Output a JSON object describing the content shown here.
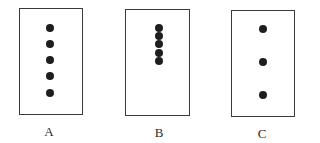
{
  "figure": {
    "panels": [
      {
        "label": "A",
        "box": {
          "x": 19,
          "y": 8,
          "w": 64,
          "h": 107
        },
        "dot_count": 5,
        "dots": [
          {
            "x": 50,
            "y": 28
          },
          {
            "x": 50,
            "y": 44
          },
          {
            "x": 50,
            "y": 60
          },
          {
            "x": 50,
            "y": 76
          },
          {
            "x": 50,
            "y": 93
          }
        ],
        "label_pos": {
          "x": 49,
          "y": 125
        }
      },
      {
        "label": "B",
        "box": {
          "x": 125,
          "y": 9,
          "w": 65,
          "h": 107
        },
        "dot_count": 5,
        "dots": [
          {
            "x": 159,
            "y": 28
          },
          {
            "x": 159,
            "y": 36
          },
          {
            "x": 159,
            "y": 44
          },
          {
            "x": 159,
            "y": 53
          },
          {
            "x": 159,
            "y": 61
          }
        ],
        "label_pos": {
          "x": 159,
          "y": 126
        }
      },
      {
        "label": "C",
        "box": {
          "x": 231,
          "y": 10,
          "w": 64,
          "h": 107
        },
        "dot_count": 3,
        "dots": [
          {
            "x": 263,
            "y": 29
          },
          {
            "x": 263,
            "y": 62
          },
          {
            "x": 263,
            "y": 95
          }
        ],
        "label_pos": {
          "x": 262,
          "y": 127
        }
      }
    ],
    "colors": {
      "border": "#3a3a3a",
      "dot": "#1e1e1e",
      "label": "#2a2a2a",
      "background": "#ffffff"
    }
  }
}
